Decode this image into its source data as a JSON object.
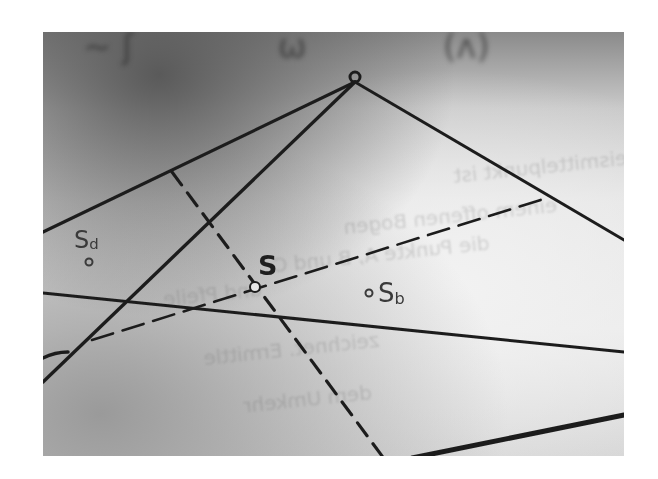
{
  "image": {
    "description": "Grayscale photo of a printed triangle geometry construction with dashed auxiliary lines",
    "colors": {
      "line": "#1e1e1e",
      "label": "#3a3a3a",
      "paper": "#e6e6e6"
    }
  },
  "labels": {
    "apex": "C",
    "centroid": "S",
    "point_d": {
      "main": "S",
      "sub": "d"
    },
    "point_b": {
      "main": "S",
      "sub": "b"
    }
  },
  "show_through_text": [
    "Umkreismittelpunkt ist",
    "einem offenen Bogen",
    "die Punkte A, B und C",
    "und Pfeile",
    "zeichnet. Ermittle",
    "dem Umkehr"
  ]
}
